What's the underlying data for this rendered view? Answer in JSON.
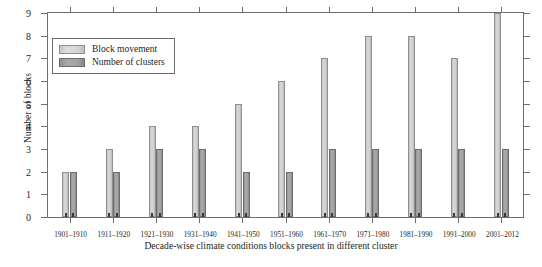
{
  "chart_data": {
    "type": "bar",
    "title": "",
    "xlabel": "Decade-wise climate conditions blocks present in different cluster",
    "ylabel": "Number of blocks",
    "ylim": [
      0,
      9
    ],
    "yticks": [
      0,
      1,
      2,
      3,
      4,
      5,
      6,
      7,
      8,
      9
    ],
    "grid": false,
    "legend_position": "top-left",
    "categories": [
      "1901–1910",
      "1911–1920",
      "1921–1930",
      "1931–1940",
      "1941–1950",
      "1951–1960",
      "1961–1970",
      "1971–1980",
      "1981–1990",
      "1991–2000",
      "2001–2012"
    ],
    "series": [
      {
        "name": "Block movement",
        "color": "#d2d2d2",
        "values": [
          2,
          3,
          4,
          4,
          5,
          6,
          7,
          8,
          8,
          7,
          9
        ]
      },
      {
        "name": "Number of clusters",
        "color": "#9c9c9c",
        "values": [
          2,
          2,
          3,
          3,
          2,
          2,
          3,
          3,
          3,
          3,
          3
        ]
      }
    ]
  },
  "legend": {
    "items": [
      {
        "label": "Block movement"
      },
      {
        "label": "Number of clusters"
      }
    ]
  },
  "axes": {
    "y_title": "Number of blocks",
    "x_title": "Decade-wise climate conditions blocks present in different cluster"
  }
}
